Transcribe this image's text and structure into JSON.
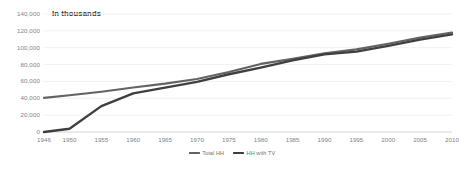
{
  "chart_data": {
    "type": "line",
    "title": "In thousands",
    "xlabel": "",
    "ylabel": "",
    "ylim": [
      0,
      140000
    ],
    "ytick_labels": [
      "140,000",
      "120,000",
      "100,000",
      "80,000",
      "60,000",
      "40,000",
      "20,000",
      "0"
    ],
    "ytick_values": [
      140000,
      120000,
      100000,
      80000,
      60000,
      40000,
      20000,
      0
    ],
    "grid": true,
    "legend_position": "bottom-center",
    "categories": [
      1946,
      1950,
      1955,
      1960,
      1965,
      1970,
      1975,
      1980,
      1985,
      1990,
      1995,
      2000,
      2005,
      2010
    ],
    "xtick_labels": [
      "1946",
      "1950",
      "1955",
      "1960",
      "1965",
      "1970",
      "1975",
      "1980",
      "1985",
      "1990",
      "1995",
      "2000",
      "2005",
      "2010"
    ],
    "series": [
      {
        "name": "HH with TV",
        "color": "#3f3f3f",
        "values": [
          8,
          3900,
          30700,
          45750,
          52700,
          59550,
          68500,
          76300,
          84900,
          92100,
          95400,
          102200,
          109600,
          115900
        ]
      },
      {
        "name": "Total HH",
        "color": "#636363",
        "values": [
          40500,
          43550,
          47800,
          52800,
          57400,
          62900,
          71100,
          80800,
          86800,
          93300,
          98000,
          104700,
          112000,
          118000
        ]
      }
    ]
  }
}
